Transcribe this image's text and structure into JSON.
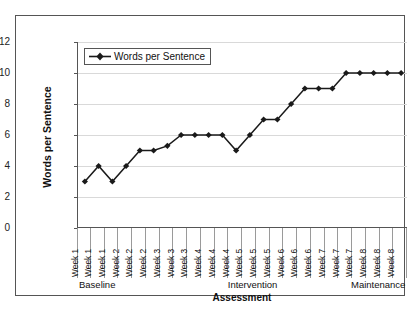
{
  "chart_data": {
    "type": "line",
    "title": "",
    "xlabel": "Assessment",
    "ylabel": "Words per Sentence",
    "ylim": [
      0,
      12
    ],
    "yticks": [
      0,
      2,
      4,
      6,
      8,
      10,
      12
    ],
    "grid": true,
    "legend_position": "top-left",
    "marker": "diamond",
    "line_color": "#1a1a1a",
    "grid_color": "#d9d9d9",
    "legend": [
      "Words per Sentence"
    ],
    "categories": [
      "Week 1",
      "Week 1",
      "Week 1",
      "Week 2",
      "Week 2",
      "Week 2",
      "Week 3",
      "Week 3",
      "Week 3",
      "Week 4",
      "Week 4",
      "Week 4",
      "Week 5",
      "Week 5",
      "Week 5",
      "Week 6",
      "Week 6",
      "Week 6",
      "Week 7",
      "Week 7",
      "Week 7",
      "Week 8",
      "Week 8",
      "Week 8"
    ],
    "series": [
      {
        "name": "Words per Sentence",
        "values": [
          3,
          4,
          3,
          4,
          5,
          5,
          5.3,
          6,
          6,
          6,
          6,
          5,
          6,
          7,
          7,
          8,
          9,
          9,
          9,
          10,
          10,
          10,
          10,
          10
        ]
      }
    ],
    "phases": [
      {
        "label": "Baseline",
        "start_index": 0,
        "end_index": 7,
        "align": "left"
      },
      {
        "label": "Intervention",
        "start_index": 8,
        "end_index": 17,
        "align": "center"
      },
      {
        "label": "Maintenance",
        "start_index": 18,
        "end_index": 23,
        "align": "right"
      }
    ]
  }
}
